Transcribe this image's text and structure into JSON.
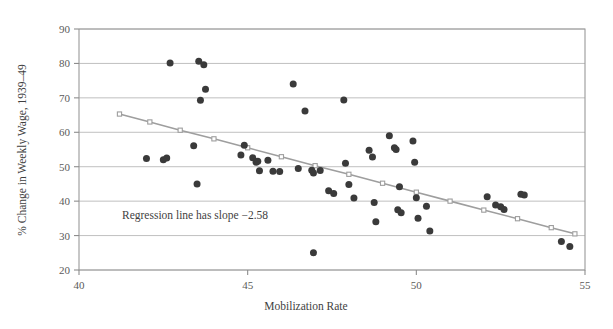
{
  "figure": {
    "background": "#ffffff",
    "point_color": "#3a3a3a",
    "line_color": "#9e9e9e",
    "grid_color": "#b9b9b9"
  },
  "annotation": {
    "regression_note": "Regression line has slope −2.58"
  },
  "chart_data": {
    "type": "scatter",
    "title": "",
    "xlabel": "Mobilization Rate",
    "ylabel": "% Change in Weekly Wage, 1939–49",
    "xlim": [
      40,
      55
    ],
    "ylim": [
      20,
      90
    ],
    "xticks": [
      40,
      45,
      50,
      55
    ],
    "xtick_labels": [
      "40",
      "45",
      "50",
      "55"
    ],
    "yticks": [
      20,
      30,
      40,
      50,
      60,
      70,
      80,
      90
    ],
    "ytick_labels": [
      "20",
      "30",
      "40",
      "50",
      "60",
      "70",
      "80",
      "90"
    ],
    "grid": true,
    "grid_axis": "y",
    "legend": null,
    "annotations": [
      {
        "text": "Regression line has slope −2.58",
        "x": 41.6,
        "y": 35.5
      }
    ],
    "series": [
      {
        "name": "State observations",
        "type": "scatter",
        "marker": "filled-circle",
        "color": "#3a3a3a",
        "points": [
          [
            42.7,
            80.1
          ],
          [
            43.55,
            80.6
          ],
          [
            43.7,
            79.6
          ],
          [
            43.75,
            72.5
          ],
          [
            43.6,
            69.3
          ],
          [
            42.0,
            52.4
          ],
          [
            42.5,
            52.0
          ],
          [
            42.6,
            52.5
          ],
          [
            43.4,
            56.1
          ],
          [
            43.5,
            45.0
          ],
          [
            44.8,
            53.4
          ],
          [
            44.9,
            56.2
          ],
          [
            45.15,
            52.6
          ],
          [
            45.25,
            51.3
          ],
          [
            45.3,
            51.6
          ],
          [
            45.35,
            48.8
          ],
          [
            45.6,
            51.9
          ],
          [
            45.75,
            48.7
          ],
          [
            45.95,
            48.6
          ],
          [
            46.35,
            74.0
          ],
          [
            46.7,
            66.2
          ],
          [
            46.95,
            25.0
          ],
          [
            46.5,
            49.5
          ],
          [
            46.9,
            49.0
          ],
          [
            46.95,
            48.2
          ],
          [
            47.15,
            48.9
          ],
          [
            47.4,
            43.0
          ],
          [
            47.55,
            42.2
          ],
          [
            47.85,
            69.4
          ],
          [
            47.9,
            51.0
          ],
          [
            48.0,
            44.8
          ],
          [
            48.15,
            40.9
          ],
          [
            48.6,
            54.8
          ],
          [
            48.7,
            52.8
          ],
          [
            48.75,
            39.6
          ],
          [
            48.8,
            34.0
          ],
          [
            49.2,
            59.0
          ],
          [
            49.35,
            55.5
          ],
          [
            49.4,
            55.0
          ],
          [
            49.45,
            37.5
          ],
          [
            49.5,
            44.2
          ],
          [
            49.55,
            36.6
          ],
          [
            49.9,
            57.5
          ],
          [
            49.95,
            51.3
          ],
          [
            50.0,
            41.0
          ],
          [
            50.05,
            35.0
          ],
          [
            50.3,
            38.5
          ],
          [
            50.4,
            31.3
          ],
          [
            52.1,
            41.3
          ],
          [
            52.35,
            38.9
          ],
          [
            52.5,
            38.4
          ],
          [
            52.6,
            37.6
          ],
          [
            53.1,
            42.0
          ],
          [
            53.2,
            41.8
          ],
          [
            54.3,
            28.3
          ],
          [
            54.55,
            26.8
          ]
        ]
      },
      {
        "name": "Regression line",
        "type": "line",
        "marker": "open-square",
        "color": "#9e9e9e",
        "slope": -2.58,
        "points": [
          [
            41.2,
            65.3
          ],
          [
            42.1,
            63.0
          ],
          [
            43.0,
            60.6
          ],
          [
            44.0,
            58.1
          ],
          [
            45.0,
            55.5
          ],
          [
            46.0,
            52.9
          ],
          [
            47.0,
            50.3
          ],
          [
            48.0,
            47.8
          ],
          [
            49.0,
            45.2
          ],
          [
            50.0,
            42.6
          ],
          [
            51.0,
            40.0
          ],
          [
            52.0,
            37.4
          ],
          [
            53.0,
            34.9
          ],
          [
            54.0,
            32.3
          ],
          [
            54.7,
            30.5
          ]
        ]
      }
    ]
  }
}
